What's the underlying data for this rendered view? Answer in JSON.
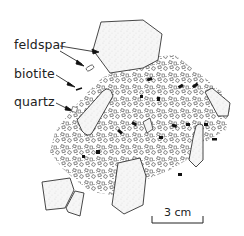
{
  "labels": {
    "feldspar": "feldspar",
    "biotite": "biotite",
    "quartz": "quartz"
  },
  "scale_bar": {
    "label": "3 cm"
  },
  "colors": {
    "ink": "#222222",
    "crystal_fill": "#f4f4f4",
    "biotite": "#111111",
    "background": "#ffffff"
  }
}
